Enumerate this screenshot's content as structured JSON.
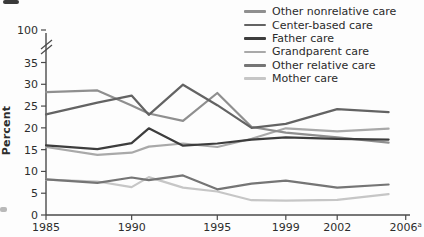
{
  "figure": {
    "background": "#fdfdfd",
    "axis_color": "#4a4a4a",
    "text_color": "#2d2d2d",
    "y_axis_label": "Percent",
    "y_break_label": "100"
  },
  "chart_data": {
    "type": "line",
    "title": "",
    "xlabel": "",
    "ylabel": "Percent",
    "grid": false,
    "legend_position": "top-right",
    "ylim": [
      0,
      35
    ],
    "y_ticks": [
      0,
      5,
      10,
      15,
      20,
      25,
      30,
      35
    ],
    "y_axis_break": {
      "label": "100",
      "note": "broken axis between 35 and 100"
    },
    "x": [
      1985,
      1988,
      1990,
      1991,
      1993,
      1995,
      1997,
      1999,
      2002,
      2005
    ],
    "x_tick_labels": [
      {
        "year": 1985,
        "label": "1985",
        "sup": ""
      },
      {
        "year": 1990,
        "label": "1990",
        "sup": ""
      },
      {
        "year": 1995,
        "label": "1995",
        "sup": ""
      },
      {
        "year": 1999,
        "label": "1999",
        "sup": ""
      },
      {
        "year": 2002,
        "label": "2002",
        "sup": ""
      },
      {
        "year": 2006,
        "label": "2006",
        "sup": "a"
      }
    ],
    "series": [
      {
        "name": "Other nonrelative care",
        "color": "#8f8f8f",
        "values": [
          28.2,
          28.6,
          25.1,
          23.3,
          21.6,
          28.0,
          20.2,
          18.9,
          17.8,
          16.6
        ]
      },
      {
        "name": "Center-based care",
        "color": "#636363",
        "values": [
          23.1,
          25.8,
          27.4,
          23.0,
          29.9,
          25.2,
          20.0,
          20.9,
          24.3,
          23.6
        ]
      },
      {
        "name": "Father care",
        "color": "#3d3d3d",
        "values": [
          16.0,
          15.1,
          16.5,
          19.9,
          15.9,
          16.4,
          17.3,
          17.8,
          17.5,
          17.3
        ]
      },
      {
        "name": "Grandparent care",
        "color": "#a9a9a9",
        "values": [
          15.6,
          13.8,
          14.3,
          15.7,
          16.4,
          15.6,
          17.5,
          19.9,
          19.2,
          19.8
        ]
      },
      {
        "name": "Other relative care",
        "color": "#757575",
        "values": [
          8.2,
          7.4,
          8.6,
          8.0,
          9.1,
          5.9,
          7.2,
          7.9,
          6.3,
          7.0
        ]
      },
      {
        "name": "Mother care",
        "color": "#c6c6c6",
        "values": [
          8.1,
          7.7,
          6.4,
          8.7,
          6.3,
          5.4,
          3.4,
          3.3,
          3.5,
          4.8
        ]
      }
    ]
  }
}
